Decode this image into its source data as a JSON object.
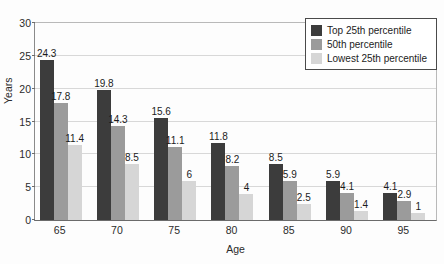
{
  "chart_data": {
    "type": "bar",
    "title": "",
    "subtitle": "",
    "xlabel": "Age",
    "ylabel": "Years",
    "categories": [
      "65",
      "70",
      "75",
      "80",
      "85",
      "90",
      "95"
    ],
    "series": [
      {
        "name": "Top 25th percentile",
        "color": "#3c3c3c",
        "values": [
          24.3,
          19.8,
          15.6,
          11.8,
          8.5,
          5.9,
          4.1
        ],
        "labels": [
          "24.3",
          "19.8",
          "15.6",
          "11.8",
          "8.5",
          "5.9",
          "4.1"
        ]
      },
      {
        "name": "50th percentile",
        "color": "#9b9b9b",
        "values": [
          17.8,
          14.3,
          11.1,
          8.2,
          5.9,
          4.1,
          2.9
        ],
        "labels": [
          "17.8",
          "14.3",
          "11.1",
          "8.2",
          "5.9",
          "4.1",
          "2.9"
        ]
      },
      {
        "name": "Lowest 25th percentile",
        "color": "#d6d6d6",
        "values": [
          11.4,
          8.5,
          6,
          4,
          2.5,
          1.4,
          1
        ],
        "labels": [
          "11.4",
          "8.5",
          "6",
          "4",
          "2.5",
          "1.4",
          "1"
        ]
      }
    ],
    "ylim": [
      0,
      30
    ],
    "yticks": [
      0,
      5,
      10,
      15,
      20,
      25,
      30
    ],
    "ytick_labels": [
      "0",
      "5",
      "10",
      "15",
      "20",
      "25",
      "30"
    ],
    "grid": true,
    "grid_axis": "y",
    "legend_position": "top-right",
    "background_color": "#fdfdfd",
    "grid_color": "#d8d8d8",
    "axis_color": "#6b6b6b",
    "text_color": "#1c1c1c"
  }
}
